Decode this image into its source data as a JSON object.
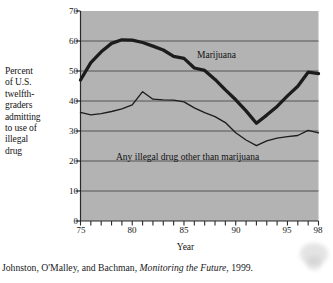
{
  "figure": {
    "y_axis_caption_lines": [
      "Percent",
      "of U.S.",
      "twelfth-",
      "graders",
      "admitting",
      "to use of",
      "illegal",
      "drug"
    ],
    "x_axis_title": "Year",
    "caption_prefix": "Johnston, O'Malley, and Bachman, ",
    "caption_italic": "Monitoring the Future",
    "caption_suffix": ", 1999.",
    "plot_background": "#b3b3b3",
    "gridline_color": "#4a4a4a",
    "series_color": "#1c1c1c"
  },
  "chart_data": {
    "type": "line",
    "title": "",
    "xlabel": "Year",
    "ylabel": "Percent of U.S. twelfth-graders admitting to use of illegal drug",
    "xlim": [
      75,
      98
    ],
    "ylim": [
      0,
      70
    ],
    "yticks": [
      0,
      10,
      20,
      30,
      40,
      50,
      60,
      70
    ],
    "ytick_labels": [
      "0",
      "10",
      "20",
      "30",
      "40",
      "50",
      "60",
      "70"
    ],
    "xticks": [
      75,
      76,
      77,
      78,
      79,
      80,
      81,
      82,
      83,
      84,
      85,
      86,
      87,
      88,
      89,
      90,
      91,
      92,
      93,
      94,
      95,
      96,
      97,
      98
    ],
    "xtick_labels_shown": [
      {
        "value": 75,
        "label": "75"
      },
      {
        "value": 80,
        "label": "80"
      },
      {
        "value": 85,
        "label": "85"
      },
      {
        "value": 90,
        "label": "90"
      },
      {
        "value": 95,
        "label": "95"
      },
      {
        "value": 98,
        "label": "98"
      }
    ],
    "grid": "horizontal",
    "legend_position": "inline-annotations",
    "x": [
      75,
      76,
      77,
      78,
      79,
      80,
      81,
      82,
      83,
      84,
      85,
      86,
      87,
      88,
      89,
      90,
      91,
      92,
      93,
      94,
      95,
      96,
      97,
      98
    ],
    "series": [
      {
        "name": "Marijuana",
        "label_position": {
          "x": 86.5,
          "y": 54
        },
        "line_width": "thick",
        "values": [
          47.0,
          52.8,
          56.4,
          59.2,
          60.4,
          60.3,
          59.5,
          58.3,
          57.0,
          54.9,
          54.2,
          51.0,
          50.2,
          47.2,
          43.7,
          40.4,
          36.7,
          32.6,
          35.3,
          38.2,
          41.7,
          44.9,
          49.6,
          49.1
        ]
      },
      {
        "name": "Any illegal drug other than marijuana",
        "label_position": {
          "x": 82,
          "y": 22.8
        },
        "line_width": "thin",
        "values": [
          36.2,
          35.4,
          35.8,
          36.5,
          37.4,
          38.7,
          43.1,
          40.6,
          40.4,
          40.3,
          39.7,
          37.7,
          36.1,
          34.8,
          32.8,
          29.4,
          27.0,
          25.1,
          26.7,
          27.6,
          28.1,
          28.5,
          30.2,
          29.4
        ]
      }
    ]
  }
}
